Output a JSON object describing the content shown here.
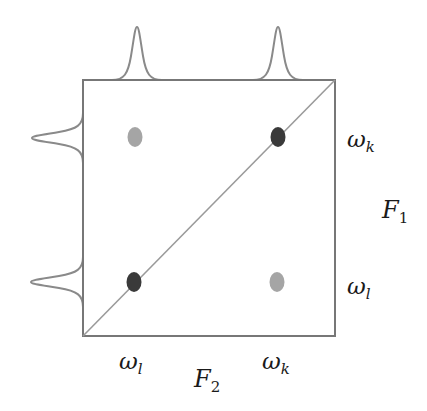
{
  "diagram": {
    "type": "2D spectroscopy cross-peak diagram",
    "colors": {
      "frame": "#777777",
      "diagonal": "#9a9a9a",
      "spectrum_curve": "#8a8a8a",
      "diagonal_peak": "#3a3a3a",
      "cross_peak": "#a5a5a5",
      "text": "#1a1a1a"
    },
    "axes": {
      "horizontal": {
        "symbol": "F",
        "subscript": "2",
        "ticks": [
          {
            "symbol": "ω",
            "subscript": "l"
          },
          {
            "symbol": "ω",
            "subscript": "k"
          }
        ]
      },
      "vertical": {
        "symbol": "F",
        "subscript": "1",
        "ticks": [
          {
            "symbol": "ω",
            "subscript": "k"
          },
          {
            "symbol": "ω",
            "subscript": "l"
          }
        ]
      }
    },
    "peaks": [
      {
        "name": "cross-peak-top-left",
        "kind": "cross",
        "position": "(ω_l, ω_k)"
      },
      {
        "name": "diagonal-peak-top-right",
        "kind": "diagonal",
        "position": "(ω_k, ω_k)"
      },
      {
        "name": "diagonal-peak-bottom-left",
        "kind": "diagonal",
        "position": "(ω_l, ω_l)"
      },
      {
        "name": "cross-peak-bottom-right",
        "kind": "cross",
        "position": "(ω_k, ω_l)"
      }
    ],
    "projections": {
      "top": [
        "ω_l",
        "ω_k"
      ],
      "left": [
        "ω_k",
        "ω_l"
      ]
    }
  }
}
